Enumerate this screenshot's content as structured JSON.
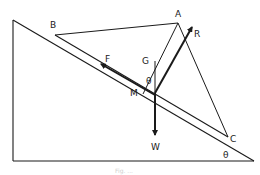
{
  "diagram": {
    "type": "statics-force-diagram",
    "labels": {
      "A": "A",
      "B": "B",
      "C": "C",
      "G": "G",
      "M": "M",
      "F": "F",
      "R": "R",
      "W": "W",
      "theta_top": "θ",
      "theta_base": "θ"
    },
    "caption": "Fig. ...",
    "colors": {
      "line": "#1a1a1a",
      "background": "#ffffff"
    }
  }
}
